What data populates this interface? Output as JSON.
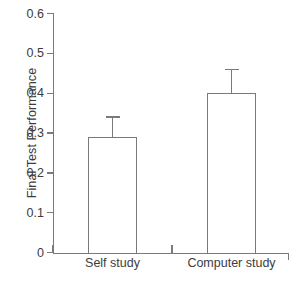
{
  "chart_data": {
    "type": "bar",
    "title": "",
    "xlabel": "",
    "ylabel": "Final Test Performance",
    "categories": [
      "Self study",
      "Computer study"
    ],
    "values": [
      0.29,
      0.4
    ],
    "errors": [
      0.05,
      0.06
    ],
    "ylim": [
      0,
      0.6
    ],
    "yticks": [
      0,
      0.1,
      0.2,
      0.3,
      0.4,
      0.5,
      0.6
    ],
    "ytick_labels": [
      "0",
      "0.1",
      "0.2",
      "0.3",
      "0.4",
      "0.5",
      "0.6"
    ],
    "grid": false,
    "legend": "none",
    "error_bar_style": "upper-only-cap",
    "bar_fill": "#ffffff",
    "line_color": "#7a7a7a",
    "text_color": "#3c3c3c"
  }
}
